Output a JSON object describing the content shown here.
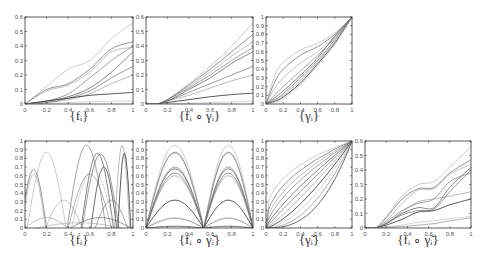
{
  "chart_data": [
    {
      "id": "f",
      "type": "line",
      "title": "{f_i}",
      "caption": "{fᵢ}",
      "xlim": [
        0,
        1
      ],
      "ylim": [
        0,
        0.6
      ],
      "xticks": [
        0,
        0.2,
        0.4,
        0.6,
        0.8,
        1
      ],
      "yticks": [
        0,
        0.1,
        0.2,
        0.3,
        0.4,
        0.5,
        0.6
      ],
      "grid": false,
      "series": [
        {
          "name": "f1",
          "x": [
            0,
            0.2,
            0.4,
            0.6,
            0.8,
            1
          ],
          "values": [
            0,
            0.12,
            0.24,
            0.3,
            0.45,
            0.56
          ]
        },
        {
          "name": "f2",
          "x": [
            0,
            0.2,
            0.4,
            0.6,
            0.8,
            1
          ],
          "values": [
            0,
            0.1,
            0.14,
            0.24,
            0.38,
            0.43
          ]
        },
        {
          "name": "f3",
          "x": [
            0,
            0.2,
            0.4,
            0.6,
            0.8,
            1
          ],
          "values": [
            0,
            0.09,
            0.13,
            0.22,
            0.36,
            0.39
          ]
        },
        {
          "name": "f4",
          "x": [
            0,
            0.2,
            0.4,
            0.6,
            0.8,
            1
          ],
          "values": [
            0,
            0.02,
            0.07,
            0.18,
            0.3,
            0.4
          ]
        },
        {
          "name": "f5",
          "x": [
            0,
            0.2,
            0.4,
            0.6,
            0.8,
            1
          ],
          "values": [
            0,
            0.02,
            0.05,
            0.11,
            0.22,
            0.36
          ]
        },
        {
          "name": "f6",
          "x": [
            0,
            0.2,
            0.4,
            0.6,
            0.8,
            1
          ],
          "values": [
            0,
            0.01,
            0.04,
            0.09,
            0.18,
            0.26
          ]
        },
        {
          "name": "f7",
          "x": [
            0,
            0.2,
            0.4,
            0.6,
            0.8,
            1
          ],
          "values": [
            0,
            0.01,
            0.03,
            0.07,
            0.14,
            0.2
          ]
        },
        {
          "name": "f8",
          "x": [
            0,
            0.2,
            0.4,
            0.6,
            0.8,
            1
          ],
          "values": [
            0,
            0.02,
            0.04,
            0.06,
            0.07,
            0.08
          ]
        },
        {
          "name": "f9",
          "x": [
            0,
            0.2,
            0.4,
            0.6,
            0.8,
            1
          ],
          "values": [
            0,
            0.005,
            0.01,
            0.015,
            0.02,
            0.02
          ]
        }
      ]
    },
    {
      "id": "fgamma",
      "type": "line",
      "title": "{f_i ∘ γ_i}",
      "caption": "{fᵢ ∘ γᵢ}",
      "xlim": [
        0,
        1
      ],
      "ylim": [
        0,
        0.6
      ],
      "xticks": [
        0,
        0.2,
        0.4,
        0.6,
        0.8,
        1
      ],
      "yticks": [
        0,
        0.1,
        0.2,
        0.3,
        0.4,
        0.5,
        0.6
      ],
      "grid": false,
      "series": [
        {
          "name": "g1",
          "x": [
            0,
            0.1,
            0.2,
            0.4,
            0.6,
            0.8,
            1
          ],
          "values": [
            0,
            0,
            0.03,
            0.14,
            0.26,
            0.4,
            0.56
          ]
        },
        {
          "name": "g2",
          "x": [
            0,
            0.1,
            0.2,
            0.4,
            0.6,
            0.8,
            1
          ],
          "values": [
            0,
            0,
            0.03,
            0.13,
            0.24,
            0.36,
            0.48
          ]
        },
        {
          "name": "g3",
          "x": [
            0,
            0.1,
            0.2,
            0.4,
            0.6,
            0.8,
            1
          ],
          "values": [
            0,
            0,
            0.03,
            0.12,
            0.22,
            0.33,
            0.43
          ]
        },
        {
          "name": "g4",
          "x": [
            0,
            0.1,
            0.2,
            0.4,
            0.6,
            0.8,
            1
          ],
          "values": [
            0,
            0,
            0.03,
            0.11,
            0.2,
            0.3,
            0.39
          ]
        },
        {
          "name": "g5",
          "x": [
            0,
            0.1,
            0.2,
            0.4,
            0.6,
            0.8,
            1
          ],
          "values": [
            0,
            0,
            0.02,
            0.1,
            0.18,
            0.28,
            0.36
          ]
        },
        {
          "name": "g6",
          "x": [
            0,
            0.1,
            0.2,
            0.4,
            0.6,
            0.8,
            1
          ],
          "values": [
            0,
            0,
            0.02,
            0.08,
            0.14,
            0.2,
            0.26
          ]
        },
        {
          "name": "g7",
          "x": [
            0,
            0.1,
            0.2,
            0.4,
            0.6,
            0.8,
            1
          ],
          "values": [
            0,
            0,
            0.02,
            0.06,
            0.11,
            0.16,
            0.2
          ]
        },
        {
          "name": "g8",
          "x": [
            0,
            0.1,
            0.2,
            0.4,
            0.6,
            0.8,
            1
          ],
          "values": [
            0,
            0,
            0.01,
            0.03,
            0.05,
            0.065,
            0.075
          ]
        },
        {
          "name": "g9",
          "x": [
            0,
            0.1,
            0.2,
            0.4,
            0.6,
            0.8,
            1
          ],
          "values": [
            0,
            0,
            0.002,
            0.005,
            0.01,
            0.015,
            0.02
          ]
        }
      ]
    },
    {
      "id": "gamma",
      "type": "line",
      "title": "{γ_i}",
      "caption": "{γᵢ}",
      "xlim": [
        0,
        1
      ],
      "ylim": [
        0,
        1
      ],
      "xticks": [
        0,
        0.2,
        0.4,
        0.6,
        0.8,
        1
      ],
      "yticks": [
        0,
        0.1,
        0.2,
        0.3,
        0.4,
        0.5,
        0.6,
        0.7,
        0.8,
        0.9,
        1
      ],
      "grid": false,
      "series": [
        {
          "name": "w1",
          "x": [
            0,
            0.1,
            0.2,
            0.4,
            0.6,
            0.8,
            1
          ],
          "values": [
            0,
            0.32,
            0.48,
            0.62,
            0.7,
            0.82,
            1
          ]
        },
        {
          "name": "w2",
          "x": [
            0,
            0.1,
            0.2,
            0.4,
            0.6,
            0.8,
            1
          ],
          "values": [
            0,
            0.25,
            0.4,
            0.56,
            0.66,
            0.8,
            1
          ]
        },
        {
          "name": "w3",
          "x": [
            0,
            0.1,
            0.2,
            0.4,
            0.6,
            0.8,
            1
          ],
          "values": [
            0,
            0.18,
            0.3,
            0.47,
            0.6,
            0.78,
            1
          ]
        },
        {
          "name": "w4",
          "x": [
            0,
            0.1,
            0.2,
            0.4,
            0.6,
            0.8,
            1
          ],
          "values": [
            0,
            0.1,
            0.2,
            0.38,
            0.56,
            0.76,
            1
          ]
        },
        {
          "name": "w5",
          "x": [
            0,
            0.1,
            0.2,
            0.4,
            0.6,
            0.8,
            1
          ],
          "values": [
            0,
            0.07,
            0.15,
            0.33,
            0.53,
            0.78,
            1
          ]
        },
        {
          "name": "w6",
          "x": [
            0,
            0.1,
            0.2,
            0.4,
            0.6,
            0.8,
            1
          ],
          "values": [
            0,
            0.05,
            0.12,
            0.3,
            0.5,
            0.74,
            1
          ]
        },
        {
          "name": "w7",
          "x": [
            0,
            0.1,
            0.2,
            0.4,
            0.6,
            0.8,
            1
          ],
          "values": [
            0,
            0.04,
            0.1,
            0.27,
            0.48,
            0.72,
            1
          ]
        },
        {
          "name": "w8",
          "x": [
            0,
            0.1,
            0.2,
            0.4,
            0.6,
            0.8,
            1
          ],
          "values": [
            0,
            0.03,
            0.08,
            0.24,
            0.46,
            0.7,
            1
          ]
        },
        {
          "name": "w9",
          "x": [
            0,
            0.1,
            0.2,
            0.4,
            0.6,
            0.8,
            1
          ],
          "values": [
            0,
            0.02,
            0.06,
            0.22,
            0.44,
            0.68,
            1
          ]
        }
      ]
    },
    {
      "id": "fdot",
      "type": "line",
      "title": "{ḟ_i}",
      "caption": "{ḟᵢ}",
      "xlim": [
        0,
        1
      ],
      "ylim": [
        0,
        1
      ],
      "xticks": [
        0,
        0.2,
        0.4,
        0.6,
        0.8,
        1
      ],
      "yticks": [
        0,
        0.1,
        0.2,
        0.3,
        0.4,
        0.5,
        0.6,
        0.7,
        0.8,
        0.9,
        1
      ],
      "grid": false,
      "bumps": [
        {
          "c": 0.2,
          "w": 0.18,
          "h": 0.87
        },
        {
          "c": 0.08,
          "w": 0.12,
          "h": 0.67
        },
        {
          "c": 0.08,
          "w": 0.11,
          "h": 0.62
        },
        {
          "c": 0.57,
          "w": 0.18,
          "h": 0.95
        },
        {
          "c": 0.67,
          "w": 0.15,
          "h": 0.86
        },
        {
          "c": 0.7,
          "w": 0.17,
          "h": 0.85
        },
        {
          "c": 0.9,
          "w": 0.07,
          "h": 0.95
        },
        {
          "c": 0.92,
          "w": 0.06,
          "h": 0.86
        },
        {
          "c": 0.63,
          "w": 0.2,
          "h": 0.67
        },
        {
          "c": 0.6,
          "w": 0.2,
          "h": 0.62
        },
        {
          "c": 0.73,
          "w": 0.12,
          "h": 0.7
        },
        {
          "c": 0.36,
          "w": 0.17,
          "h": 0.32
        },
        {
          "c": 0.8,
          "w": 0.15,
          "h": 0.32
        },
        {
          "c": 0.2,
          "w": 0.2,
          "h": 0.12
        },
        {
          "c": 0.7,
          "w": 0.28,
          "h": 0.12
        },
        {
          "c": 0.5,
          "w": 0.4,
          "h": 0.06
        }
      ]
    },
    {
      "id": "fdotgamma",
      "type": "line",
      "title": "{ḟ_i ∘ γ̃_i}",
      "caption": "{ḟᵢ ∘ γ̃ᵢ}",
      "xlim": [
        0,
        1
      ],
      "ylim": [
        0,
        1
      ],
      "xticks": [
        0,
        0.2,
        0.4,
        0.6,
        0.8,
        1
      ],
      "yticks": [
        0,
        0.1,
        0.2,
        0.3,
        0.4,
        0.5,
        0.6,
        0.7,
        0.8,
        0.9,
        1
      ],
      "grid": false,
      "peaks_x": [
        0.32,
        0.78
      ],
      "zeros_x": [
        0,
        0.54,
        1
      ],
      "peak_heights": [
        0.95,
        0.87,
        0.86,
        0.7,
        0.68,
        0.63,
        0.6,
        0.32,
        0.12,
        0.11,
        0.02
      ]
    },
    {
      "id": "gammatilde",
      "type": "line",
      "title": "{γ̃_i}",
      "caption": "{γ̃ᵢ}",
      "xlim": [
        0,
        1
      ],
      "ylim": [
        0,
        1
      ],
      "xticks": [
        0,
        0.2,
        0.4,
        0.6,
        0.8,
        1
      ],
      "yticks": [
        0,
        0.1,
        0.2,
        0.3,
        0.4,
        0.5,
        0.6,
        0.7,
        0.8,
        0.9,
        1
      ],
      "grid": false,
      "exponents": [
        0.35,
        0.45,
        0.55,
        0.65,
        0.8,
        0.95,
        1.15,
        1.4,
        1.7,
        2.1,
        2.6
      ]
    },
    {
      "id": "fgammatilde",
      "type": "line",
      "title": "{f_i ∘ γ̃_i}",
      "caption": "{fᵢ ∘ γ̃ᵢ}",
      "xlim": [
        0,
        1
      ],
      "ylim": [
        0,
        0.6
      ],
      "xticks": [
        0,
        0.2,
        0.4,
        0.6,
        0.8,
        1
      ],
      "yticks": [
        0,
        0.1,
        0.2,
        0.3,
        0.4,
        0.5,
        0.6
      ],
      "grid": false,
      "series": [
        {
          "name": "h1",
          "x": [
            0,
            0.1,
            0.2,
            0.35,
            0.5,
            0.65,
            0.8,
            1
          ],
          "values": [
            0,
            0,
            0.08,
            0.22,
            0.3,
            0.32,
            0.42,
            0.56
          ]
        },
        {
          "name": "h2",
          "x": [
            0,
            0.1,
            0.2,
            0.35,
            0.5,
            0.65,
            0.8,
            1
          ],
          "values": [
            0,
            0,
            0.07,
            0.2,
            0.27,
            0.28,
            0.38,
            0.47
          ]
        },
        {
          "name": "h3",
          "x": [
            0,
            0.1,
            0.2,
            0.35,
            0.5,
            0.65,
            0.8,
            1
          ],
          "values": [
            0,
            0,
            0.05,
            0.17,
            0.26,
            0.27,
            0.37,
            0.44
          ]
        },
        {
          "name": "h4",
          "x": [
            0,
            0.1,
            0.2,
            0.35,
            0.5,
            0.65,
            0.8,
            1
          ],
          "values": [
            0,
            0,
            0.04,
            0.12,
            0.17,
            0.2,
            0.32,
            0.38
          ]
        },
        {
          "name": "h5",
          "x": [
            0,
            0.1,
            0.2,
            0.35,
            0.5,
            0.65,
            0.8,
            1
          ],
          "values": [
            0,
            0,
            0.03,
            0.1,
            0.14,
            0.14,
            0.28,
            0.42
          ]
        },
        {
          "name": "h6",
          "x": [
            0,
            0.1,
            0.2,
            0.35,
            0.5,
            0.65,
            0.8,
            1
          ],
          "values": [
            0,
            0,
            0.03,
            0.09,
            0.12,
            0.13,
            0.25,
            0.4
          ]
        },
        {
          "name": "h7",
          "x": [
            0,
            0.1,
            0.2,
            0.35,
            0.5,
            0.65,
            0.8,
            1
          ],
          "values": [
            0,
            0,
            0.03,
            0.11,
            0.18,
            0.2,
            0.22,
            0.25
          ]
        },
        {
          "name": "h8",
          "x": [
            0,
            0.1,
            0.2,
            0.35,
            0.5,
            0.65,
            0.8,
            1
          ],
          "values": [
            0,
            0,
            0.02,
            0.06,
            0.11,
            0.12,
            0.16,
            0.2
          ]
        },
        {
          "name": "h9",
          "x": [
            0,
            0.1,
            0.2,
            0.35,
            0.5,
            0.65,
            0.8,
            1
          ],
          "values": [
            0,
            0,
            0.01,
            0.02,
            0.04,
            0.05,
            0.065,
            0.08
          ]
        },
        {
          "name": "h10",
          "x": [
            0,
            0.1,
            0.2,
            0.35,
            0.5,
            0.65,
            0.8,
            1
          ],
          "values": [
            0,
            0,
            0.005,
            0.01,
            0.02,
            0.03,
            0.05,
            0.07
          ]
        }
      ]
    }
  ],
  "layout": {
    "panels": [
      {
        "id": "f",
        "left": 25,
        "top": 17,
        "width": 108,
        "height": 87,
        "cap_top": 108
      },
      {
        "id": "fgamma",
        "left": 146,
        "top": 17,
        "width": 107,
        "height": 87,
        "cap_top": 108
      },
      {
        "id": "gamma",
        "left": 266,
        "top": 17,
        "width": 86,
        "height": 87,
        "cap_top": 108
      },
      {
        "id": "fdot",
        "left": 25,
        "top": 141,
        "width": 108,
        "height": 87,
        "cap_top": 232
      },
      {
        "id": "fdotgamma",
        "left": 146,
        "top": 141,
        "width": 107,
        "height": 87,
        "cap_top": 232
      },
      {
        "id": "gammatilde",
        "left": 266,
        "top": 141,
        "width": 86,
        "height": 87,
        "cap_top": 232
      },
      {
        "id": "fgammatilde",
        "left": 365,
        "top": 141,
        "width": 106,
        "height": 87,
        "cap_top": 232
      }
    ]
  },
  "colors": {
    "axis": "#333333",
    "line_light": "#9a9a9a",
    "line_dark": "#3a3a3a"
  }
}
